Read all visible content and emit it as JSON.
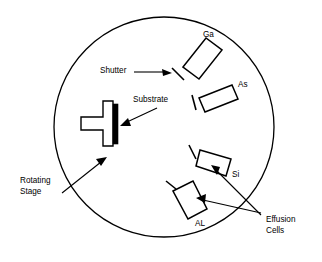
{
  "figure": {
    "background_color": "#ffffff",
    "line_color": "#000000",
    "substrate_color": "#000000",
    "chamber": {
      "name": "growth-chamber",
      "shape": "circle",
      "center_x": 164,
      "center_y": 127,
      "radius": 110
    },
    "labels": {
      "ga": "Ga",
      "as": "As",
      "si": "Si",
      "al": "AL",
      "shutter": "Shutter",
      "substrate": "Substrate",
      "rotating_stage_line1": "Rotating",
      "rotating_stage_line2": "Stage",
      "effusion_cells_line1": "Effusion",
      "effusion_cells_line2": "Cells"
    },
    "cells": [
      {
        "id": "ga",
        "label": "Ga",
        "angle_deg": -48,
        "has_shutter": true
      },
      {
        "id": "as",
        "label": "As",
        "angle_deg": -12,
        "has_shutter": true
      },
      {
        "id": "si",
        "label": "Si",
        "angle_deg": 22,
        "has_shutter": true
      },
      {
        "id": "al",
        "label": "AL",
        "angle_deg": 48,
        "has_shutter": true
      }
    ],
    "stage": {
      "name": "rotating-stage",
      "shape": "T-shaped holder",
      "substrate_attached_edge": "right"
    }
  }
}
